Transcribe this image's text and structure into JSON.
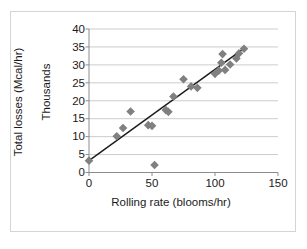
{
  "chart_data": {
    "type": "scatter",
    "title": "",
    "xlabel": "Rolling rate (blooms/hr)",
    "ylabel": "Total losses (Mcal/hr)",
    "y_units_label": "Thousands",
    "xlim": [
      0,
      150
    ],
    "ylim": [
      0,
      40
    ],
    "xticks": [
      0,
      50,
      100,
      150
    ],
    "yticks": [
      0,
      5,
      10,
      15,
      20,
      25,
      30,
      35,
      40
    ],
    "grid": "horizontal",
    "legend": "none",
    "marker_shape": "diamond",
    "marker_color": "#808080",
    "trendline_color": "#1a1a1a",
    "trendline": {
      "x": [
        0,
        123
      ],
      "y": [
        3.3,
        34.6
      ]
    },
    "points": [
      {
        "x": 0,
        "y": 3.3
      },
      {
        "x": 22,
        "y": 10.1
      },
      {
        "x": 27,
        "y": 12.4
      },
      {
        "x": 33,
        "y": 17.0
      },
      {
        "x": 47,
        "y": 13.2
      },
      {
        "x": 50,
        "y": 13.0
      },
      {
        "x": 52,
        "y": 2.1
      },
      {
        "x": 61,
        "y": 17.4
      },
      {
        "x": 63,
        "y": 16.9
      },
      {
        "x": 67,
        "y": 21.2
      },
      {
        "x": 75,
        "y": 26.0
      },
      {
        "x": 81,
        "y": 24.0
      },
      {
        "x": 86,
        "y": 23.6
      },
      {
        "x": 100,
        "y": 27.5
      },
      {
        "x": 103,
        "y": 28.4
      },
      {
        "x": 105,
        "y": 30.6
      },
      {
        "x": 106,
        "y": 33.0
      },
      {
        "x": 108,
        "y": 28.6
      },
      {
        "x": 112,
        "y": 30.1
      },
      {
        "x": 117,
        "y": 31.8
      },
      {
        "x": 119,
        "y": 33.2
      },
      {
        "x": 123,
        "y": 34.5
      }
    ]
  },
  "axes": {
    "y_title": "Total losses (Mcal/hr)",
    "y_units": "Thousands",
    "x_title": "Rolling rate (blooms/hr)",
    "y_tick_labels": [
      "40",
      "35",
      "30",
      "25",
      "20",
      "15",
      "10",
      "5",
      "0"
    ],
    "x_tick_labels": [
      "0",
      "50",
      "100",
      "150"
    ]
  },
  "colors": {
    "marker": "#808080",
    "line": "#1a1a1a",
    "grid": "#bfbfbf",
    "axis": "#8c8c8c",
    "frame": "#d4d4d4",
    "text": "#1a1a1a",
    "background": "#ffffff"
  }
}
